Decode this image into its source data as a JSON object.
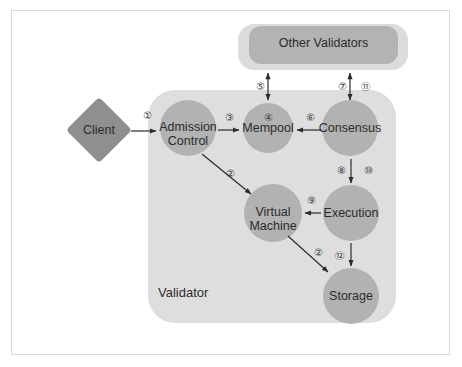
{
  "diagram": {
    "colors": {
      "page_background": "#ffffff",
      "frame_border": "#d9d9d9",
      "validator_box": "#dedede",
      "other_validators_outer": "#dcdcdc",
      "other_validators_inner": "#b3b3b3",
      "node_circle": "#b2b2b2",
      "client_diamond": "#8f8f8f",
      "arrow": "#2b2b2b",
      "text": "#2b2b2b"
    },
    "containers": [
      {
        "id": "validator",
        "label": "Validator",
        "shape": "rounded-rect"
      },
      {
        "id": "other-validators",
        "label": "Other Validators",
        "shape": "rounded-rect"
      }
    ],
    "nodes": [
      {
        "id": "client",
        "label": "Client",
        "shape": "diamond"
      },
      {
        "id": "admission-control",
        "label": "Admission\nControl",
        "shape": "circle"
      },
      {
        "id": "mempool",
        "label": "Mempool",
        "shape": "circle"
      },
      {
        "id": "consensus",
        "label": "Consensus",
        "shape": "circle"
      },
      {
        "id": "virtual-machine",
        "label": "Virtual\nMachine",
        "shape": "circle"
      },
      {
        "id": "execution",
        "label": "Execution",
        "shape": "circle"
      },
      {
        "id": "storage",
        "label": "Storage",
        "shape": "circle"
      }
    ],
    "edges": [
      {
        "id": "e1",
        "from": "client",
        "to": "admission-control",
        "label": "①",
        "direction": "forward"
      },
      {
        "id": "e2a",
        "from": "admission-control",
        "to": "virtual-machine",
        "label": "②",
        "direction": "forward"
      },
      {
        "id": "e3",
        "from": "admission-control",
        "to": "mempool",
        "label": "③",
        "direction": "forward"
      },
      {
        "id": "e4",
        "from": "mempool",
        "to": "mempool",
        "label": "④",
        "direction": "none"
      },
      {
        "id": "e5",
        "from": "other-validators",
        "to": "mempool",
        "label": "⑤",
        "direction": "both"
      },
      {
        "id": "e6",
        "from": "consensus",
        "to": "mempool",
        "label": "⑥",
        "direction": "forward"
      },
      {
        "id": "e7",
        "from": "consensus",
        "to": "other-validators",
        "label": "⑦",
        "direction": "both"
      },
      {
        "id": "e11",
        "from": "other-validators",
        "to": "consensus",
        "label": "⑪",
        "direction": "both"
      },
      {
        "id": "e8",
        "from": "consensus",
        "to": "execution",
        "label": "⑧",
        "direction": "forward"
      },
      {
        "id": "e10",
        "from": "consensus",
        "to": "execution",
        "label": "⑩",
        "direction": "forward"
      },
      {
        "id": "e9",
        "from": "execution",
        "to": "virtual-machine",
        "label": "⑨",
        "direction": "forward"
      },
      {
        "id": "e2b",
        "from": "virtual-machine",
        "to": "storage",
        "label": "②",
        "direction": "forward"
      },
      {
        "id": "e12",
        "from": "execution",
        "to": "storage",
        "label": "⑫",
        "direction": "forward"
      }
    ]
  }
}
